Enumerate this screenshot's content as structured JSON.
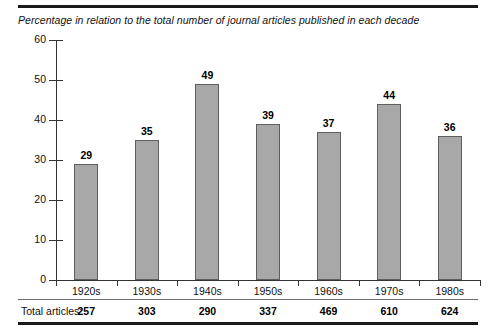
{
  "chart_data": {
    "type": "bar",
    "title": "Percentage in relation to the total number of journal articles published in each decade",
    "xlabel": "",
    "ylabel": "",
    "ylim": [
      0,
      60
    ],
    "yticks": [
      0,
      10,
      20,
      30,
      40,
      50,
      60
    ],
    "grid": false,
    "legend": "none",
    "categories": [
      "1920s",
      "1930s",
      "1940s",
      "1950s",
      "1960s",
      "1970s",
      "1980s"
    ],
    "values": [
      29,
      35,
      49,
      39,
      37,
      44,
      36
    ],
    "value_labels": [
      "29",
      "35",
      "49",
      "39",
      "37",
      "44",
      "36"
    ],
    "bar_color": "#a8a8a8",
    "bar_border_color": "#5e5e5e",
    "footer": {
      "label": "Total articles:",
      "values": [
        "257",
        "303",
        "290",
        "337",
        "469",
        "610",
        "624"
      ]
    }
  },
  "axis": {
    "ytick_labels": [
      "60",
      "50",
      "40",
      "30",
      "20",
      "10",
      "0"
    ]
  }
}
